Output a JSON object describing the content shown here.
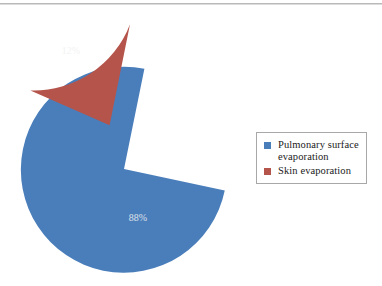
{
  "chart_data": {
    "type": "pie",
    "title": "",
    "categories": [
      "Pulmonary surface evaporation",
      "Skin evaporation"
    ],
    "values": [
      88,
      12
    ],
    "data_labels": [
      "88%",
      "12%"
    ],
    "colors": [
      "#4a7ebb",
      "#b5544a"
    ],
    "exploded": [
      false,
      true
    ],
    "start_angle_deg": 12,
    "legend_position": "right",
    "grid": false,
    "xlabel": "",
    "ylabel": ""
  },
  "figure": {
    "background_color": "#ffffff",
    "rule_color": "#b9b9b9"
  },
  "pie": {
    "slices": [
      {
        "name": "pulmonary-surface-evaporation",
        "label": "88%",
        "value": 88,
        "color": "#4a7ebb",
        "label_x": 138,
        "label_y": 219
      },
      {
        "name": "skin-evaporation",
        "label": "12%",
        "value": 12,
        "color": "#b5544a",
        "label_x": 71,
        "label_y": 52
      }
    ]
  },
  "legend": {
    "border_color": "#a8a8a8",
    "items": [
      {
        "label": "Pulmonary surface\nevaporation",
        "color": "#4a7ebb"
      },
      {
        "label": "Skin evaporation",
        "color": "#b5544a"
      }
    ]
  }
}
